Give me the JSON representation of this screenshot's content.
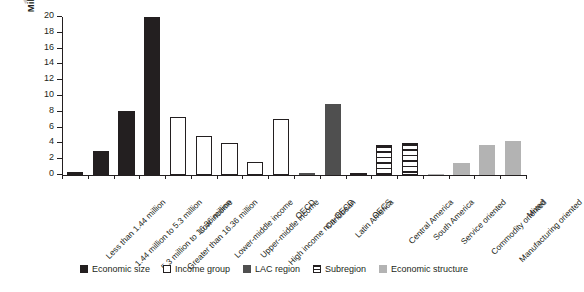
{
  "figure": {
    "top_glyph": "▼"
  },
  "chart_data": {
    "type": "bar",
    "title": "",
    "xlabel": "",
    "ylabel": "Millions of people",
    "ylim": [
      0,
      20
    ],
    "ytick_values": [
      0,
      2,
      4,
      6,
      8,
      10,
      12,
      14,
      16,
      18,
      20
    ],
    "ytick_labels": [
      "0",
      "2",
      "4",
      "6",
      "8",
      "10",
      "12",
      "14",
      "16",
      "18",
      "20"
    ],
    "grid": false,
    "legend_position": "bottom",
    "categories": [
      "Less than 1.44 million",
      "1.44 million to 5.3 million",
      "5.3 million to 16.36 million",
      "Greater than 16.36 million",
      "Low income",
      "Lower-middle income",
      "Upper-middle income",
      "High income non-OECD",
      "OECD",
      "Caribbean",
      "Latin America",
      "OECS",
      "Central America",
      "South America",
      "Service oriented",
      "Commodity oriented",
      "Manufacturing oriented",
      "Mixed"
    ],
    "values": [
      0.35,
      3.1,
      8.1,
      20.0,
      7.4,
      5.0,
      4.1,
      1.6,
      7.15,
      0.25,
      9.0,
      0.08,
      3.75,
      4.0,
      0.1,
      1.5,
      3.8,
      4.3
    ],
    "groups": [
      "economic_size",
      "economic_size",
      "economic_size",
      "economic_size",
      "income_group",
      "income_group",
      "income_group",
      "income_group",
      "income_group",
      "lac_region",
      "lac_region",
      "subregion",
      "subregion",
      "subregion",
      "economic_structure",
      "economic_structure",
      "economic_structure",
      "economic_structure"
    ],
    "legend": [
      {
        "key": "economic_size",
        "label": "Economic size",
        "color": "#231f20"
      },
      {
        "key": "income_group",
        "label": "Income group",
        "color": "#ffffff"
      },
      {
        "key": "lac_region",
        "label": "LAC region",
        "color": "#4f4f4f"
      },
      {
        "key": "subregion",
        "label": "Subregion",
        "color": "#ffffff"
      },
      {
        "key": "economic_structure",
        "label": "Economic structure",
        "color": "#b3b3b3"
      }
    ]
  }
}
